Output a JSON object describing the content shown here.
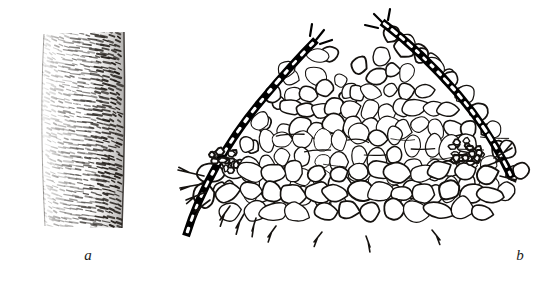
{
  "figure": {
    "kind": "botanical-line-illustration",
    "background_color": "#ffffff",
    "ink_color": "#15120f",
    "width_px": 539,
    "height_px": 288,
    "panels": [
      {
        "id": "a",
        "label": "a",
        "label_style": "italic-serif-lowercase",
        "caption_position": "below-center",
        "subject": "spiral (helically) thickened vessel element, side view",
        "description": "cylindrical tube rendered with dense short horizontal dash hatching forming helical bands; right flank shaded darker to suggest curvature",
        "bounds": {
          "x": 42,
          "y": 30,
          "width": 84,
          "height": 198
        },
        "render": {
          "band_count": 46,
          "dashes_per_band": 13,
          "tube_top_width": 78,
          "tube_bottom_width": 80,
          "shade_side": "right"
        }
      },
      {
        "id": "b",
        "label": "b",
        "label_style": "italic-serif-lowercase",
        "caption_position": "below-center",
        "subject": "transverse section of leaf / stem showing cellular tissue beneath a thick cuticle",
        "description": "two convex ridges bordered by a heavy black cuticle with white cell lumina embedded; a V-shaped notch separates the ridges; below lie small polygonal epidermal cells, then radially elongated palisade-like columns, then large rounded parenchyma; two lateral bundle-like clusters of small dark cells at mid-left and mid-right",
        "bounds": {
          "x": 185,
          "y": 8,
          "width": 340,
          "height": 222
        },
        "tissue_layers": [
          {
            "name": "cuticle",
            "style": "thick black band with white dashes",
            "thickness_px": 7
          },
          {
            "name": "epidermis",
            "style": "small polygonal cells"
          },
          {
            "name": "hypodermis / palisade",
            "style": "radially elongated cell columns"
          },
          {
            "name": "ground parenchyma",
            "style": "large rounded cells"
          },
          {
            "name": "bundle clusters",
            "style": "small dark angular cells",
            "count": 2
          }
        ]
      }
    ]
  },
  "colors": {
    "ink": "#15120f",
    "cuticle": "#000000",
    "paper": "#ffffff",
    "label": "#1a1a1a"
  }
}
